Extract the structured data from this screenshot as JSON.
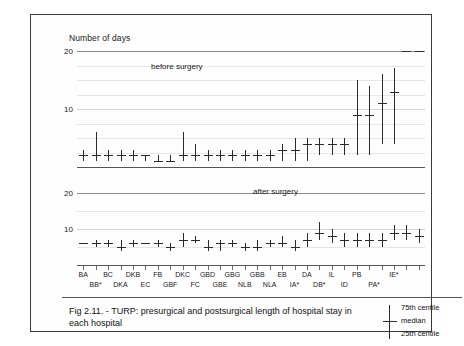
{
  "figure": {
    "y_axis_title": "Number of days",
    "caption": "Fig 2.11. - TURP: presurgical and postsurgical length of hospital stay in each hospital",
    "panel_labels": {
      "top": "before surgery",
      "bottom": "after surgery"
    }
  },
  "legend": {
    "upper": "75th centile",
    "middle": "median",
    "lower": "25th centile"
  },
  "chart_data": {
    "type": "line",
    "title": "TURP: presurgical and postsurgical length of hospital stay in each hospital",
    "xlabel": "",
    "ylabel": "Number of days",
    "grid": true,
    "legend_position": "bottom-right",
    "categories": [
      "BA",
      "BB*",
      "BC",
      "DKA",
      "DKB",
      "EC",
      "FB",
      "GBF",
      "DKC",
      "FC",
      "GBD",
      "GBE",
      "GBG",
      "BE",
      "GBB",
      "NLB",
      "EB",
      "NLA",
      "DA",
      "IA*",
      "IL",
      "DB*",
      "PB",
      "ID",
      "IE*",
      "PA*",
      "PB2",
      "IE2"
    ],
    "panels": [
      {
        "name": "before surgery",
        "ylim": [
          0,
          20
        ],
        "yticks": [
          10,
          20
        ],
        "gridlines": [
          2.5,
          5,
          7.5,
          10,
          12.5,
          15,
          17.5,
          20
        ],
        "series": [
          {
            "name": "25th centile",
            "values": [
              1,
              1,
              1,
              1,
              1,
              1,
              1,
              1,
              1,
              1,
              1,
              1,
              1,
              1,
              1,
              1,
              1,
              1,
              1,
              2,
              2,
              2,
              2,
              2,
              4,
              4,
              5,
              6
            ]
          },
          {
            "name": "median",
            "values": [
              2,
              2,
              2,
              2,
              2,
              2,
              1,
              1,
              2,
              2,
              2,
              2,
              2,
              2,
              2,
              2,
              3,
              3,
              4,
              4,
              4,
              4,
              9,
              9,
              11,
              13
            ]
          },
          {
            "name": "75th centile",
            "values": [
              3,
              6,
              3,
              3,
              3,
              2,
              2,
              2,
              6,
              4,
              3,
              3,
              3,
              3,
              3,
              3,
              4,
              5,
              5,
              5,
              5,
              5,
              15,
              14,
              16,
              17
            ]
          }
        ]
      },
      {
        "name": "after surgery",
        "ylim": [
          0,
          20
        ],
        "yticks": [
          10,
          20
        ],
        "gridlines": [
          5,
          10,
          15,
          20
        ],
        "series": [
          {
            "name": "25th centile",
            "values": [
              6,
              5,
              5,
              4,
              5,
              6,
              5,
              4,
              5,
              6,
              4,
              4,
              5,
              4,
              4,
              5,
              5,
              4,
              5,
              7,
              6,
              5,
              5,
              5,
              5,
              7,
              7,
              6
            ]
          },
          {
            "name": "median",
            "values": [
              6,
              6,
              6,
              5,
              6,
              6,
              6,
              5,
              7,
              7,
              5,
              6,
              6,
              5,
              5,
              6,
              6,
              5,
              7,
              9,
              8,
              7,
              7,
              7,
              7,
              9,
              9,
              8
            ]
          },
          {
            "name": "75th centile",
            "values": [
              6,
              7,
              7,
              7,
              7,
              6,
              7,
              6,
              9,
              8,
              7,
              7,
              7,
              6,
              7,
              7,
              8,
              7,
              9,
              12,
              10,
              9,
              9,
              9,
              9,
              11,
              11,
              10
            ]
          }
        ]
      }
    ],
    "xtick_labels_row1": [
      {
        "label": "BA",
        "index": 0
      },
      {
        "label": "BC",
        "index": 2
      },
      {
        "label": "DKB",
        "index": 4
      },
      {
        "label": "FB",
        "index": 6
      },
      {
        "label": "DKC",
        "index": 8
      },
      {
        "label": "GBD",
        "index": 10
      },
      {
        "label": "GBG",
        "index": 12
      },
      {
        "label": "GBB",
        "index": 14
      },
      {
        "label": "EB",
        "index": 16
      },
      {
        "label": "DA",
        "index": 18
      },
      {
        "label": "IL",
        "index": 20
      },
      {
        "label": "PB",
        "index": 22
      },
      {
        "label": "IE*",
        "index": 25
      }
    ],
    "xtick_labels_row2": [
      {
        "label": "BB*",
        "index": 1
      },
      {
        "label": "DKA",
        "index": 3
      },
      {
        "label": "EC",
        "index": 5
      },
      {
        "label": "GBF",
        "index": 7
      },
      {
        "label": "FC",
        "index": 9
      },
      {
        "label": "GBE",
        "index": 11
      },
      {
        "label": "NLB",
        "index": 13
      },
      {
        "label": "NLA",
        "index": 15
      },
      {
        "label": "IA*",
        "index": 17
      },
      {
        "label": "DB*",
        "index": 19
      },
      {
        "label": "ID",
        "index": 21
      },
      {
        "label": "PA*",
        "index": 23.4
      }
    ]
  }
}
